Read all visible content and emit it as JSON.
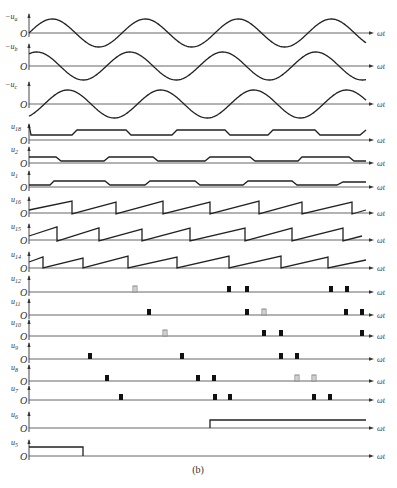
{
  "figure": {
    "caption": "(b)",
    "x_axis_label": "ωt",
    "origin_label": "O",
    "colors": {
      "trace": "#222222",
      "axis": "#555555",
      "pulse_solid": "#111111",
      "pulse_hollow": "#888888"
    }
  },
  "geometry": {
    "x0": 29,
    "x_end": 366,
    "arrow_x": 374,
    "period_px": 93
  },
  "rows": [
    {
      "id": "ua",
      "label": "−u",
      "sub": "a",
      "baseline": 33,
      "type": "sine",
      "amp": 14,
      "phase_px": 0,
      "sign": 1
    },
    {
      "id": "ub",
      "label": "−u",
      "sub": "b",
      "baseline": 66,
      "type": "sine",
      "amp": 14,
      "phase_px": 31,
      "sign": -1
    },
    {
      "id": "uc",
      "label": "−u",
      "sub": "c",
      "baseline": 104,
      "type": "sine",
      "amp": 14,
      "phase_px": -31,
      "sign": -1
    },
    {
      "id": "u18",
      "label": "u",
      "sub": "18",
      "baseline": 140,
      "type": "trapezoid",
      "points": [
        [
          29,
          125
        ],
        [
          31,
          135
        ],
        [
          72,
          135
        ],
        [
          77,
          130
        ],
        [
          126,
          130
        ],
        [
          131,
          135
        ],
        [
          172,
          135
        ],
        [
          177,
          130
        ],
        [
          225,
          130
        ],
        [
          230,
          135
        ],
        [
          268,
          135
        ],
        [
          273,
          130
        ],
        [
          315,
          130
        ],
        [
          320,
          135
        ],
        [
          360,
          135
        ],
        [
          366,
          130
        ]
      ]
    },
    {
      "id": "u2",
      "label": "u",
      "sub": "2",
      "baseline": 163,
      "type": "trapezoid",
      "points": [
        [
          29,
          157
        ],
        [
          56,
          157
        ],
        [
          61,
          161
        ],
        [
          104,
          161
        ],
        [
          109,
          157
        ],
        [
          153,
          157
        ],
        [
          158,
          161
        ],
        [
          205,
          161
        ],
        [
          210,
          157
        ],
        [
          250,
          157
        ],
        [
          255,
          161
        ],
        [
          298,
          161
        ],
        [
          302,
          157
        ],
        [
          349,
          157
        ],
        [
          354,
          161
        ],
        [
          366,
          161
        ]
      ]
    },
    {
      "id": "u1",
      "label": "u",
      "sub": "1",
      "baseline": 187,
      "type": "trapezoid",
      "points": [
        [
          29,
          185
        ],
        [
          50,
          185
        ],
        [
          54,
          181
        ],
        [
          105,
          181
        ],
        [
          110,
          185
        ],
        [
          145,
          185
        ],
        [
          150,
          181
        ],
        [
          195,
          181
        ],
        [
          200,
          185
        ],
        [
          243,
          185
        ],
        [
          248,
          181
        ],
        [
          292,
          181
        ],
        [
          297,
          185
        ],
        [
          337,
          185
        ],
        [
          343,
          182
        ],
        [
          366,
          182
        ]
      ]
    },
    {
      "id": "u16",
      "label": "u",
      "sub": "16",
      "baseline": 213,
      "type": "sawtooth",
      "points": [
        [
          29,
          210
        ],
        [
          72,
          201
        ],
        [
          72,
          214
        ],
        [
          116,
          202
        ],
        [
          116,
          214
        ],
        [
          163,
          201
        ],
        [
          163,
          214
        ],
        [
          210,
          202
        ],
        [
          210,
          214
        ],
        [
          259,
          201
        ],
        [
          259,
          214
        ],
        [
          302,
          202
        ],
        [
          302,
          214
        ],
        [
          352,
          202
        ],
        [
          352,
          214
        ],
        [
          366,
          210
        ]
      ]
    },
    {
      "id": "u15",
      "label": "u",
      "sub": "15",
      "baseline": 240,
      "type": "sawtooth",
      "points": [
        [
          29,
          236
        ],
        [
          57,
          227
        ],
        [
          57,
          241
        ],
        [
          99,
          228
        ],
        [
          99,
          241
        ],
        [
          142,
          229
        ],
        [
          142,
          241
        ],
        [
          190,
          228
        ],
        [
          190,
          241
        ],
        [
          245,
          228
        ],
        [
          245,
          241
        ],
        [
          292,
          228
        ],
        [
          292,
          241
        ],
        [
          343,
          228
        ],
        [
          343,
          241
        ],
        [
          362,
          236
        ]
      ]
    },
    {
      "id": "u14",
      "label": "u",
      "sub": "14",
      "baseline": 268,
      "type": "sawtooth",
      "points": [
        [
          29,
          262
        ],
        [
          43,
          257
        ],
        [
          43,
          268
        ],
        [
          83,
          258
        ],
        [
          83,
          268
        ],
        [
          128,
          256
        ],
        [
          128,
          268
        ],
        [
          177,
          257
        ],
        [
          177,
          268
        ],
        [
          229,
          256
        ],
        [
          229,
          268
        ],
        [
          281,
          256
        ],
        [
          281,
          268
        ],
        [
          328,
          257
        ],
        [
          328,
          268
        ],
        [
          366,
          260
        ]
      ]
    },
    {
      "id": "u12",
      "label": "u",
      "sub": "12",
      "baseline": 292,
      "type": "pulses",
      "pulses": [
        [
          135,
          "hollow"
        ],
        [
          229,
          "solid"
        ],
        [
          247,
          "solid"
        ],
        [
          331,
          "solid"
        ],
        [
          347,
          "solid"
        ]
      ]
    },
    {
      "id": "u11",
      "label": "u",
      "sub": "11",
      "baseline": 315,
      "type": "pulses",
      "pulses": [
        [
          149,
          "solid"
        ],
        [
          247,
          "solid"
        ],
        [
          264,
          "hollow"
        ],
        [
          346,
          "solid"
        ],
        [
          362,
          "solid"
        ]
      ]
    },
    {
      "id": "u10",
      "label": "u",
      "sub": "10",
      "baseline": 336,
      "type": "pulses",
      "pulses": [
        [
          165,
          "hollow"
        ],
        [
          264,
          "solid"
        ],
        [
          281,
          "solid"
        ],
        [
          362,
          "solid"
        ]
      ]
    },
    {
      "id": "u9",
      "label": "u",
      "sub": "9",
      "baseline": 359,
      "type": "pulses",
      "pulses": [
        [
          90,
          "solid"
        ],
        [
          182,
          "solid"
        ],
        [
          281,
          "solid"
        ],
        [
          297,
          "solid"
        ]
      ]
    },
    {
      "id": "u8",
      "label": "u",
      "sub": "8",
      "baseline": 381,
      "type": "pulses",
      "pulses": [
        [
          107,
          "solid"
        ],
        [
          198,
          "solid"
        ],
        [
          214,
          "solid"
        ],
        [
          297,
          "hollow"
        ],
        [
          314,
          "hollow"
        ]
      ]
    },
    {
      "id": "u7",
      "label": "u",
      "sub": "7",
      "baseline": 400,
      "type": "pulses",
      "pulses": [
        [
          121,
          "solid"
        ],
        [
          215,
          "solid"
        ],
        [
          230,
          "solid"
        ],
        [
          314,
          "solid"
        ],
        [
          330,
          "solid"
        ]
      ]
    },
    {
      "id": "u6",
      "label": "u",
      "sub": "6",
      "baseline": 428,
      "type": "step",
      "points": [
        [
          210,
          428
        ],
        [
          210,
          420
        ],
        [
          366,
          420
        ]
      ]
    },
    {
      "id": "u5",
      "label": "u",
      "sub": "5",
      "baseline": 456,
      "type": "step",
      "points": [
        [
          29,
          447
        ],
        [
          83,
          447
        ],
        [
          83,
          456
        ]
      ]
    }
  ],
  "labels": {
    "ua": "−ua",
    "ub": "−ub",
    "uc": "−uc",
    "u18": "u18",
    "u2": "u2",
    "u1": "u1",
    "u16": "u16",
    "u15": "u15",
    "u14": "u14",
    "u12": "u12",
    "u11": "u11",
    "u10": "u10",
    "u9": "u9",
    "u8": "u8",
    "u7": "u7",
    "u6": "u6",
    "u5": "u5"
  }
}
